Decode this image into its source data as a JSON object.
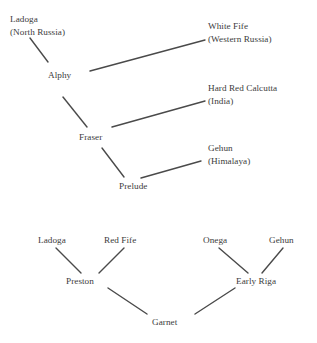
{
  "diagram": {
    "type": "pedigree",
    "title": "",
    "background_color": "#ffffff",
    "line_color": "#4a4a4a",
    "text_color": "#3c3c3c",
    "pedigrees": [
      {
        "id": "marquis-lineage",
        "nodes": [
          {
            "id": "ladoga-top",
            "name": "Ladoga",
            "origin": "(North Russia)",
            "x": 10,
            "y": 13,
            "anchor": "left"
          },
          {
            "id": "white-fife",
            "name": "White Fife",
            "origin": "(Western Russia)",
            "x": 208,
            "y": 20,
            "anchor": "left"
          },
          {
            "id": "alphy",
            "name": "Alphy",
            "origin": "",
            "x": 48,
            "y": 69,
            "anchor": "left"
          },
          {
            "id": "hard-red-calcutta",
            "name": "Hard Red Calcutta",
            "origin": "(India)",
            "x": 208,
            "y": 82,
            "anchor": "left"
          },
          {
            "id": "fraser",
            "name": "Fraser",
            "origin": "",
            "x": 79,
            "y": 131,
            "anchor": "left"
          },
          {
            "id": "gehun-top",
            "name": "Gehun",
            "origin": "(Himalaya)",
            "x": 208,
            "y": 142,
            "anchor": "left"
          },
          {
            "id": "prelude",
            "name": "Prelude",
            "origin": "",
            "x": 119,
            "y": 180,
            "anchor": "left"
          }
        ],
        "edges": [
          {
            "from": "ladoga-top",
            "to": "alphy",
            "x1": 30,
            "y1": 38,
            "x2": 48,
            "y2": 62
          },
          {
            "from": "alphy",
            "to": "white-fife",
            "x1": 90,
            "y1": 71,
            "x2": 205,
            "y2": 40
          },
          {
            "from": "alphy",
            "to": "fraser",
            "x1": 63,
            "y1": 97,
            "x2": 87,
            "y2": 127
          },
          {
            "from": "fraser",
            "to": "hard-red-calcutta",
            "x1": 112,
            "y1": 127,
            "x2": 205,
            "y2": 101
          },
          {
            "from": "fraser",
            "to": "prelude",
            "x1": 102,
            "y1": 148,
            "x2": 124,
            "y2": 177
          },
          {
            "from": "prelude",
            "to": "gehun-top",
            "x1": 141,
            "y1": 178,
            "x2": 201,
            "y2": 161
          }
        ]
      },
      {
        "id": "garnet-lineage",
        "nodes": [
          {
            "id": "ladoga-bottom",
            "name": "Ladoga",
            "origin": "",
            "x": 38,
            "y": 234,
            "anchor": "left"
          },
          {
            "id": "red-fife",
            "name": "Red Fife",
            "origin": "",
            "x": 104,
            "y": 234,
            "anchor": "left"
          },
          {
            "id": "onega",
            "name": "Onega",
            "origin": "",
            "x": 203,
            "y": 234,
            "anchor": "left"
          },
          {
            "id": "gehun-bottom",
            "name": "Gehun",
            "origin": "",
            "x": 269,
            "y": 234,
            "anchor": "left"
          },
          {
            "id": "preston",
            "name": "Preston",
            "origin": "",
            "x": 66,
            "y": 275,
            "anchor": "left"
          },
          {
            "id": "early-riga",
            "name": "Early Riga",
            "origin": "",
            "x": 236,
            "y": 275,
            "anchor": "left"
          },
          {
            "id": "garnet",
            "name": "Garnet",
            "origin": "",
            "x": 152,
            "y": 316,
            "anchor": "left"
          }
        ],
        "edges": [
          {
            "from": "ladoga-bottom",
            "to": "preston",
            "x1": 56,
            "y1": 248,
            "x2": 81,
            "y2": 273
          },
          {
            "from": "red-fife",
            "to": "preston",
            "x1": 124,
            "y1": 248,
            "x2": 99,
            "y2": 273
          },
          {
            "from": "preston",
            "to": "garnet",
            "x1": 108,
            "y1": 288,
            "x2": 147,
            "y2": 314
          },
          {
            "from": "onega",
            "to": "early-riga",
            "x1": 219,
            "y1": 248,
            "x2": 248,
            "y2": 273
          },
          {
            "from": "gehun-bottom",
            "to": "early-riga",
            "x1": 283,
            "y1": 248,
            "x2": 262,
            "y2": 273
          },
          {
            "from": "garnet",
            "to": "early-riga",
            "x1": 195,
            "y1": 314,
            "x2": 235,
            "y2": 288
          }
        ]
      }
    ]
  },
  "chart_data": {
    "type": "diagram",
    "subtype": "pedigree-tree",
    "title": "",
    "node_names": [
      "Ladoga",
      "White Fife",
      "Alphy",
      "Hard Red Calcutta",
      "Fraser",
      "Gehun",
      "Prelude",
      "Ladoga",
      "Red Fife",
      "Onega",
      "Gehun",
      "Preston",
      "Early Riga",
      "Garnet"
    ],
    "origins": {
      "Ladoga": "(North Russia)",
      "White Fife": "(Western Russia)",
      "Hard Red Calcutta": "(India)",
      "Gehun": "(Himalaya)"
    },
    "relationships": [
      [
        "Ladoga",
        "Alphy"
      ],
      [
        "White Fife",
        "Alphy"
      ],
      [
        "Alphy",
        "Fraser"
      ],
      [
        "Hard Red Calcutta",
        "Fraser"
      ],
      [
        "Fraser",
        "Prelude"
      ],
      [
        "Gehun",
        "Prelude"
      ],
      [
        "Ladoga",
        "Preston"
      ],
      [
        "Red Fife",
        "Preston"
      ],
      [
        "Onega",
        "Early Riga"
      ],
      [
        "Gehun",
        "Early Riga"
      ],
      [
        "Preston",
        "Garnet"
      ],
      [
        "Early Riga",
        "Garnet"
      ]
    ]
  }
}
